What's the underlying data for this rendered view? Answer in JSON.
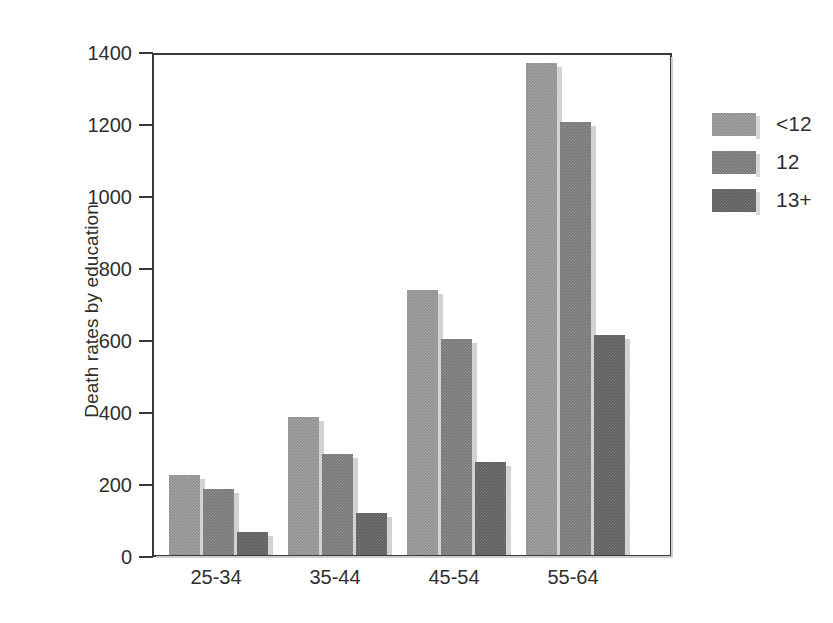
{
  "chart_data": {
    "type": "bar",
    "title": "",
    "xlabel": "",
    "ylabel": "Death rates by education",
    "categories": [
      "25-34",
      "35-44",
      "45-54",
      "55-64"
    ],
    "series": [
      {
        "name": "<12",
        "values": [
          222,
          382,
          735,
          1368
        ],
        "color": "#8e8e8e"
      },
      {
        "name": "12",
        "values": [
          182,
          281,
          600,
          1203
        ],
        "color": "#767676"
      },
      {
        "name": "13+",
        "values": [
          64,
          118,
          259,
          610
        ],
        "color": "#5e5e5e"
      }
    ],
    "ylim": [
      0,
      1400
    ],
    "yticks": [
      0,
      200,
      400,
      600,
      800,
      1000,
      1200,
      1400
    ],
    "ytick_labels": [
      "0",
      "200",
      "400",
      "600",
      "800",
      "1000",
      "1200",
      "1400"
    ],
    "grid": false,
    "legend_position": "right",
    "legend_entries": [
      "<12",
      "12",
      "13+"
    ]
  },
  "figure": {
    "background_color": "#ffffff",
    "axis_color": "#3a3a3a",
    "text_color": "#2f2f2f"
  }
}
